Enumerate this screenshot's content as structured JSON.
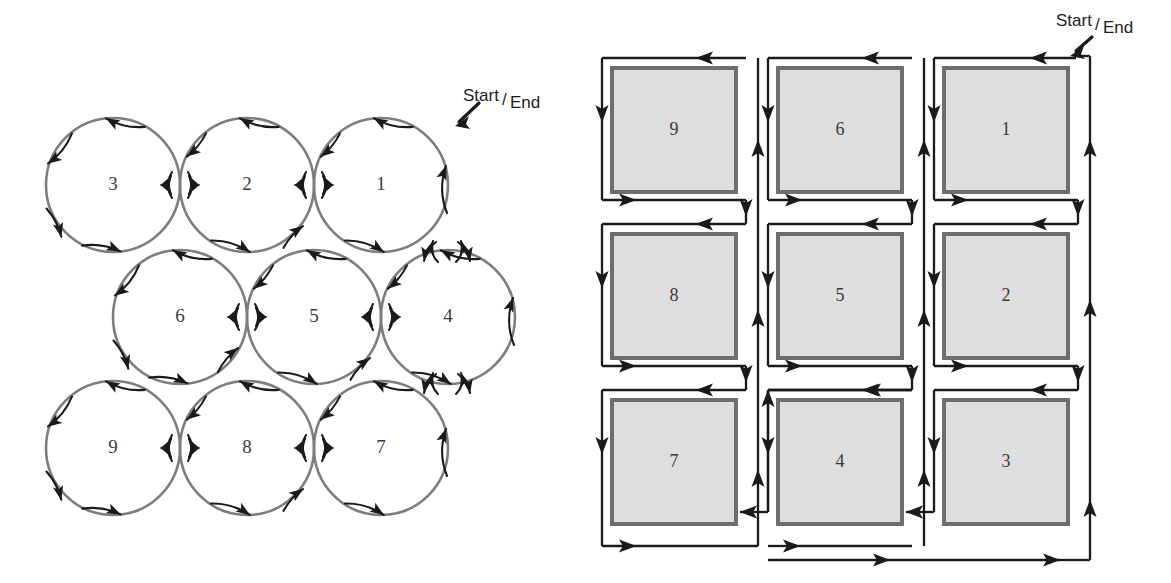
{
  "figure": {
    "title": "",
    "background_color": "#ffffff"
  },
  "colors": {
    "circle_stroke": "#7d7d7d",
    "arrow_stroke": "#1a1a1a",
    "square_fill": "#dedede",
    "square_border": "#6e6e6e",
    "number_text": "#3c3c3c",
    "label_text": "#1c1c1c"
  },
  "left_diagram": {
    "name": "circle-packing-path-diagram",
    "start_end_label": {
      "prefix": "Start",
      "separator": "/",
      "suffix": "End"
    },
    "geometry": {
      "radius": 67,
      "col_spacing": 134,
      "row_spacing": 131,
      "row_offset": 67
    },
    "circles": [
      {
        "label": "3",
        "cx": 113,
        "cy": 185
      },
      {
        "label": "2",
        "cx": 247,
        "cy": 185
      },
      {
        "label": "1",
        "cx": 381,
        "cy": 185
      },
      {
        "label": "6",
        "cx": 180,
        "cy": 317
      },
      {
        "label": "5",
        "cx": 314,
        "cy": 317
      },
      {
        "label": "4",
        "cx": 448,
        "cy": 317
      },
      {
        "label": "9",
        "cx": 113,
        "cy": 448
      },
      {
        "label": "8",
        "cx": 247,
        "cy": 448
      },
      {
        "label": "7",
        "cx": 381,
        "cy": 448
      }
    ],
    "arrow_direction": "counter-clockwise around each circle",
    "start_marker": {
      "x": 462,
      "y": 120
    }
  },
  "right_diagram": {
    "name": "square-grid-path-diagram",
    "start_end_label": {
      "prefix": "Start",
      "separator": "/",
      "suffix": "End"
    },
    "geometry": {
      "square_size": 124,
      "col_spacing": 166,
      "row_spacing": 166,
      "origin_x": 612,
      "origin_y": 68
    },
    "squares": [
      {
        "label": "9",
        "x": 612,
        "y": 68
      },
      {
        "label": "6",
        "x": 778,
        "y": 68
      },
      {
        "label": "1",
        "x": 944,
        "y": 68
      },
      {
        "label": "8",
        "x": 612,
        "y": 234
      },
      {
        "label": "5",
        "x": 778,
        "y": 234
      },
      {
        "label": "2",
        "x": 944,
        "y": 234
      },
      {
        "label": "7",
        "x": 612,
        "y": 400
      },
      {
        "label": "4",
        "x": 778,
        "y": 400
      },
      {
        "label": "3",
        "x": 944,
        "y": 400
      }
    ],
    "arrow_direction": "counter-clockwise around each square, serpentine between columns",
    "start_marker": {
      "x": 1075,
      "y": 45
    }
  }
}
